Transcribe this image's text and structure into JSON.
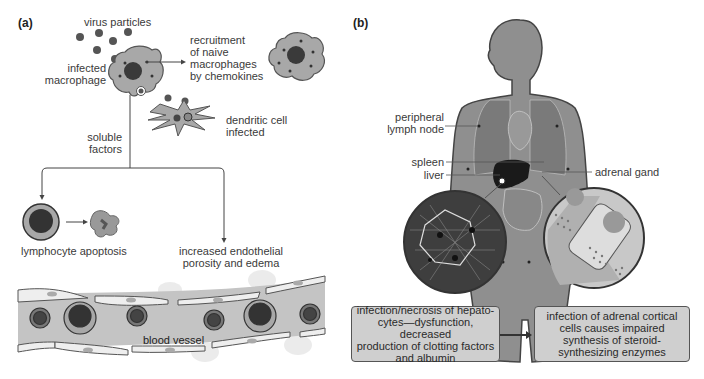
{
  "panel_a": {
    "label": "(a)",
    "virus_particles": "virus particles",
    "infected_macrophage": [
      "infected",
      "macrophage"
    ],
    "recruitment": [
      "recruitment",
      "of naive",
      "macrophages",
      "by chemokines"
    ],
    "dendritic_cell": [
      "dendritic cell",
      "infected"
    ],
    "soluble_factors": [
      "soluble",
      "factors"
    ],
    "lymphocyte_apoptosis": "lymphocyte apoptosis",
    "endothelial": [
      "increased endothelial",
      "porosity and edema"
    ],
    "blood_vessel": "blood vessel"
  },
  "panel_b": {
    "label": "(b)",
    "peripheral_lymph_node": [
      "peripheral",
      "lymph node"
    ],
    "spleen": "spleen",
    "liver": "liver",
    "adrenal_gland": "adrenal gand",
    "liver_box": [
      "infection/necrosis of hepato-",
      "cytes—dysfunction, decreased",
      "production of clotting factors",
      "and albumin"
    ],
    "adrenal_box": [
      "infection of adrenal cortical",
      "cells causes impaired",
      "synthesis of steroid-",
      "synthesizing enzymes"
    ]
  },
  "colors": {
    "cell_fill": "#a8a8a8",
    "nucleus": "#3a3a3a",
    "body_fill": "#8f8f8f",
    "vessel_fill": "#c4c4c4",
    "box_fill": "#cfcfcf"
  }
}
